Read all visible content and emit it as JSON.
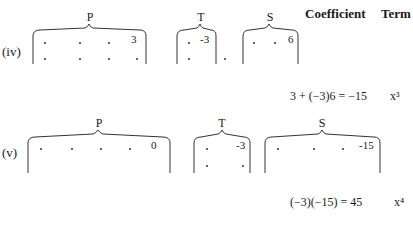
{
  "header": {
    "coefficient": "Coefficient",
    "term": "Term"
  },
  "rows": [
    {
      "label": "(iv)",
      "groups": {
        "P": {
          "letter": "P",
          "value": "3"
        },
        "T": {
          "letter": "T",
          "value": "-3"
        },
        "S": {
          "letter": "S",
          "value": "6"
        }
      },
      "equation": "3 + (−3)6 = −15",
      "term": "x³"
    },
    {
      "label": "(v)",
      "groups": {
        "P": {
          "letter": "P",
          "value": "0"
        },
        "T": {
          "letter": "T",
          "value": "-3"
        },
        "S": {
          "letter": "S",
          "value": "-15"
        }
      },
      "equation": "(−3)(−15) = 45",
      "term": "x⁴"
    }
  ]
}
